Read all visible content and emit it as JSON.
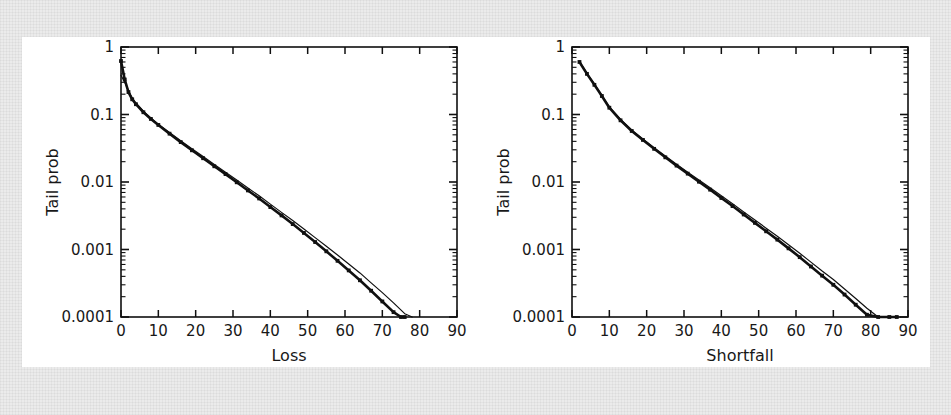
{
  "figure": {
    "background_color": "#ebebeb",
    "panel_color": "#ffffff",
    "line_color": "#101010"
  },
  "chart_data": [
    {
      "type": "line",
      "id": "loss-panel",
      "title": "",
      "xlabel": "Loss",
      "ylabel": "Tail prob",
      "yscale": "log",
      "xscale": "linear",
      "xlim": [
        0,
        90
      ],
      "ylim": [
        0.0001,
        1
      ],
      "grid": false,
      "legend": "none",
      "xticks": [
        0,
        10,
        20,
        30,
        40,
        50,
        60,
        70,
        80,
        90
      ],
      "xticklabels": [
        "0",
        "10",
        "20",
        "30",
        "40",
        "50",
        "60",
        "70",
        "80",
        "90"
      ],
      "yticks": [
        1,
        0.1,
        0.01,
        0.001,
        0.0001
      ],
      "yticklabels": [
        "1",
        "0.1",
        "0.01",
        "0.001",
        "0.0001"
      ],
      "minor_ticks": true,
      "series": [
        {
          "name": "empirical",
          "style": "solid-with-markers",
          "x": [
            0,
            1,
            2,
            3,
            4,
            6,
            8,
            10,
            13,
            16,
            19,
            22,
            25,
            28,
            31,
            34,
            37,
            40,
            43,
            46,
            49,
            52,
            55,
            58,
            61,
            64,
            67,
            70,
            73,
            75,
            76
          ],
          "y": [
            0.62,
            0.33,
            0.215,
            0.168,
            0.142,
            0.108,
            0.086,
            0.07,
            0.052,
            0.039,
            0.0295,
            0.0225,
            0.0171,
            0.0131,
            0.0099,
            0.0075,
            0.0057,
            0.00425,
            0.0032,
            0.00238,
            0.00176,
            0.00129,
            0.00094,
            0.00068,
            0.00049,
            0.00035,
            0.000245,
            0.00017,
            0.000118,
            0.0001,
            0.0001
          ]
        },
        {
          "name": "model",
          "style": "solid-thin",
          "x": [
            0,
            1,
            2,
            3,
            4,
            6,
            8,
            10,
            13,
            16,
            19,
            22,
            25,
            28,
            31,
            34,
            37,
            40,
            43,
            46,
            49,
            52,
            55,
            58,
            61,
            64,
            67,
            70,
            73,
            76,
            78
          ],
          "y": [
            0.38,
            0.3,
            0.225,
            0.176,
            0.148,
            0.112,
            0.089,
            0.072,
            0.054,
            0.041,
            0.0312,
            0.0238,
            0.0182,
            0.014,
            0.0107,
            0.00815,
            0.00625,
            0.0047,
            0.00355,
            0.00268,
            0.00201,
            0.0015,
            0.00112,
            0.00083,
            0.00061,
            0.00045,
            0.00032,
            0.00023,
            0.000162,
            0.000112,
            0.0001
          ]
        }
      ]
    },
    {
      "type": "line",
      "id": "shortfall-panel",
      "title": "",
      "xlabel": "Shortfall",
      "ylabel": "Tail prob",
      "yscale": "log",
      "xscale": "linear",
      "xlim": [
        0,
        90
      ],
      "ylim": [
        0.0001,
        1
      ],
      "grid": false,
      "legend": "none",
      "xticks": [
        0,
        10,
        20,
        30,
        40,
        50,
        60,
        70,
        80,
        90
      ],
      "xticklabels": [
        "0",
        "10",
        "20",
        "30",
        "40",
        "50",
        "60",
        "70",
        "80",
        "90"
      ],
      "yticks": [
        1,
        0.1,
        0.01,
        0.001,
        0.0001
      ],
      "yticklabels": [
        "1",
        "0.1",
        "0.01",
        "0.001",
        "0.0001"
      ],
      "minor_ticks": true,
      "series": [
        {
          "name": "empirical",
          "style": "solid-with-markers",
          "x": [
            2,
            4,
            6,
            8,
            10,
            13,
            16,
            19,
            22,
            25,
            28,
            31,
            34,
            37,
            40,
            43,
            46,
            49,
            52,
            55,
            58,
            61,
            64,
            67,
            70,
            73,
            76,
            79,
            82,
            85,
            87
          ],
          "y": [
            0.6,
            0.4,
            0.275,
            0.188,
            0.126,
            0.082,
            0.057,
            0.042,
            0.031,
            0.0232,
            0.0175,
            0.0133,
            0.0101,
            0.0077,
            0.0058,
            0.0044,
            0.0033,
            0.00248,
            0.00186,
            0.0014,
            0.00104,
            0.00077,
            0.00056,
            0.00041,
            0.0003,
            0.000215,
            0.000152,
            0.000108,
            0.0001,
            0.0001,
            0.0001
          ]
        },
        {
          "name": "model",
          "style": "solid-thin",
          "x": [
            2,
            4,
            6,
            8,
            10,
            13,
            16,
            19,
            22,
            25,
            28,
            31,
            34,
            37,
            40,
            43,
            46,
            49,
            52,
            55,
            58,
            61,
            64,
            67,
            70,
            73,
            76,
            79,
            82,
            85,
            88
          ],
          "y": [
            0.61,
            0.41,
            0.282,
            0.193,
            0.13,
            0.085,
            0.059,
            0.0435,
            0.0322,
            0.0242,
            0.0183,
            0.014,
            0.0107,
            0.00822,
            0.00625,
            0.00478,
            0.0036,
            0.00274,
            0.00207,
            0.00157,
            0.00118,
            0.00088,
            0.00065,
            0.00048,
            0.00036,
            0.00026,
            0.000188,
            0.000135,
            9.85e-05,
            0.0001,
            0.0001
          ]
        }
      ]
    }
  ]
}
